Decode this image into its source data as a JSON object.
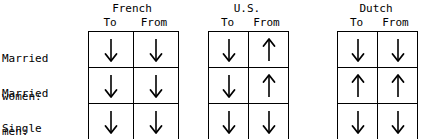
{
  "figure": {
    "row_labels": [
      {
        "line1": "Married",
        "line2": "women:"
      },
      {
        "line1": "Married",
        "line2": "men:"
      },
      {
        "line1": "Single",
        "line2": "women:"
      }
    ],
    "column_headers": [
      "To",
      "From"
    ],
    "groups": [
      {
        "name": "French",
        "left": 88,
        "width": 88,
        "columns": [
          "To",
          "From"
        ],
        "rows": [
          [
            "down",
            "down"
          ],
          [
            "down",
            "down"
          ],
          [
            "down",
            "down"
          ]
        ]
      },
      {
        "name": "U.S.",
        "left": 208,
        "width": 78,
        "columns": [
          "To",
          "From"
        ],
        "rows": [
          [
            "down",
            "up"
          ],
          [
            "down",
            "up"
          ],
          [
            "down",
            "down"
          ]
        ]
      },
      {
        "name": "Dutch",
        "left": 337,
        "width": 78,
        "columns": [
          "To",
          "From"
        ],
        "rows": [
          [
            "down",
            "down"
          ],
          [
            "up",
            "up"
          ],
          [
            "down",
            "down"
          ]
        ]
      }
    ],
    "colors": {
      "background": "#ffffff",
      "text": "#000000",
      "border": "#000000",
      "arrow": "#000000"
    }
  }
}
